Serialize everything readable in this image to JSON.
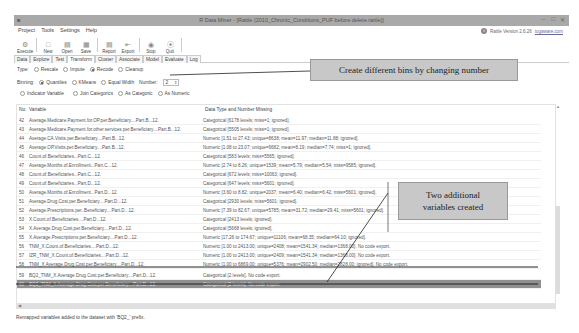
{
  "window": {
    "title": "R Data Miner - [Rattle (2010_Chronic_Conditions_PUF before delete.rattle)]",
    "controls": [
      "minimize",
      "maximize",
      "close"
    ]
  },
  "menu": [
    "Project",
    "Tools",
    "Settings",
    "Help"
  ],
  "version": {
    "text": "Rattle Version 2.6.26",
    "link": "togaware.com"
  },
  "toolbar": [
    {
      "label": "Execute",
      "icon": "execute-icon"
    },
    {
      "label": "New",
      "icon": "new-icon"
    },
    {
      "label": "Open",
      "icon": "open-icon"
    },
    {
      "label": "Save",
      "icon": "save-icon"
    },
    {
      "label": "Report",
      "icon": "report-icon"
    },
    {
      "label": "Export",
      "icon": "export-icon"
    },
    {
      "label": "Stop",
      "icon": "stop-icon"
    },
    {
      "label": "Quit",
      "icon": "quit-icon"
    }
  ],
  "tabs": [
    "Data",
    "Explore",
    "Test",
    "Transform",
    "Cluster",
    "Associate",
    "Model",
    "Evaluate",
    "Log"
  ],
  "active_tab": "Transform",
  "type_row": {
    "label": "Type:",
    "options": [
      "Rescale",
      "Impute",
      "Recode",
      "Cleanup"
    ],
    "selected": "Recode"
  },
  "binning_row": {
    "label": "Binning:",
    "options": [
      "Quantiles",
      "KMeans",
      "Equal Width"
    ],
    "selected": "Quantiles",
    "number_label": "Number:",
    "number_value": "2"
  },
  "recode_row": {
    "options": [
      "Indicator Variable",
      "Join Categorics",
      "As Categoric",
      "As Numeric"
    ]
  },
  "list": {
    "headers": {
      "no": "No.",
      "variable": "Variable",
      "type": "Data Type and Number Missing"
    },
    "rows": [
      {
        "no": "42",
        "variable": "Average.Medicare.Payment.for.OP.per.Beneficiary....Part.B...12.",
        "type": "Categorical [6178 levels; miss=1; ignored]."
      },
      {
        "no": "43",
        "variable": "Average.Medicare.Payment.for.other.services.per.Beneficiary....Part.B...12.",
        "type": "Categorical [5505 levels; miss=1; ignored]."
      },
      {
        "no": "44",
        "variable": "Average.CA.Visits.per.Beneficiary....Part.B...12.",
        "type": "Numeric [1.51 to 27.43; unique=8638; mean=11.97; median=11.88; ignored]."
      },
      {
        "no": "45",
        "variable": "Average.OP.Visits.per.Beneficiary....Part.B...12.",
        "type": "Numeric [1.08 to 23.07; unique=6682; mean=8.19; median=7.74; miss=1; ignored]."
      },
      {
        "no": "46",
        "variable": "Count.of.Beneficiaries...Part.C...12.",
        "type": "Categorical [583 levels; miss=5565; ignored]."
      },
      {
        "no": "47",
        "variable": "Average.Months.of.Enrollment...Part.C...12.",
        "type": "Numeric [2.74 to 8.26; unique=1539; mean=5.79; median=5.54; miss=9585; ignored]."
      },
      {
        "no": "48",
        "variable": "Count.of.Beneficiaries...Part.C...12.",
        "type": "Categorical [672 levels; miss=10063; ignored]."
      },
      {
        "no": "49",
        "variable": "Count.of.Beneficiaries...Part.D...12.",
        "type": "Categorical [647 levels; miss=5601; ignored]."
      },
      {
        "no": "50",
        "variable": "Average.Months.of.Enrollment...Part.D...12.",
        "type": "Numeric [3.60 to 8.82; unique=2037; mean=6.40; median=6.42; miss=5601; ignored]."
      },
      {
        "no": "51",
        "variable": "Average.Drug.Cost.per.Beneficiary....Part.D...12.",
        "type": "Categorical [2930 levels; miss=5601; ignored]."
      },
      {
        "no": "52",
        "variable": "Average.Prescriptions.per..Beneficiary....Part.D...12.",
        "type": "Numeric [7.39 to 82.67; unique=5785; mean=31.72; median=29.41; miss=5601; ignored]."
      },
      {
        "no": "53",
        "variable": "X.Count.of.Beneficiaries....Part.D...12.",
        "type": "Categorical [2413 levels; ignored]."
      },
      {
        "no": "54",
        "variable": "X.Average.Drug.Cost.per.Beneficiary....Part.D...12.",
        "type": "Categorical [5668 levels; ignored]."
      },
      {
        "no": "55",
        "variable": "X.Average.Prescriptions.per.Beneficiary....Part.D...12.",
        "type": "Numeric [17.26 to 174.67; unique=11106; mean=68.35; median=64.10; ignored]."
      },
      {
        "no": "56",
        "variable": "TNM_X.Count.of.Beneficiaries....Part.D...12.",
        "type": "Numeric [1.00 to 2413.00; unique=2408; mean=1541.34; median=1368.00]. No code export."
      },
      {
        "no": "57",
        "variable": "IZR_TNM_X.Count.of.Beneficiaries....Part.D...12.",
        "type": "Numeric [1.00 to 2413.00; unique=2409; mean=1541.34; median=1368.00]. No code export."
      },
      {
        "no": "58",
        "variable": "TNM_X.Average.Drug.Cost.per.Beneficiary....Part.D...12.",
        "type": "Numeric [1.00 to 6869.00; unique=5376; mean=2902.50; median=2828.00; ignored]. No code export."
      },
      {
        "no": "59",
        "variable": "BQ2_TNM_X.Average.Drug.Cost.per.Beneficiary....Part.D...12.",
        "type": "Categorical [2 levels]. No code export."
      },
      {
        "no": "60",
        "variable": "BQ2_TNM_X.Average.Drug.Cost.per.Beneficiary....Part.D...12.",
        "type": "Categorical [2 levels]. No code export."
      }
    ],
    "selected_row": "60"
  },
  "status": "Remapped variables added to the dataset with 'BQ2_' prefix.",
  "annotations": {
    "callout1": "Create different bins by changing number",
    "callout2_line1": "Two additional",
    "callout2_line2": "variables created"
  }
}
